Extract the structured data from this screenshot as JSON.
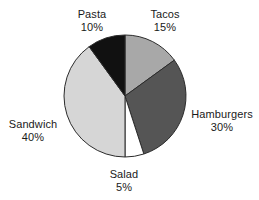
{
  "chart_data": {
    "type": "pie",
    "title": "",
    "subtitle": "",
    "xlabel": "",
    "ylabel": "",
    "legend_position": "none",
    "grid": false,
    "label_format": "name + percent",
    "start_angle_deg": 0,
    "direction": "clockwise",
    "categories": [
      "Tacos",
      "Hamburgers",
      "Salad",
      "Sandwich",
      "Pasta"
    ],
    "values": [
      15,
      30,
      5,
      40,
      10
    ],
    "slices": [
      {
        "name": "Tacos",
        "percent": 15,
        "percent_text": "15%",
        "color": "#a8a8a8",
        "stroke": "#2b2b2b"
      },
      {
        "name": "Hamburgers",
        "percent": 30,
        "percent_text": "30%",
        "color": "#555555",
        "stroke": "#2b2b2b"
      },
      {
        "name": "Salad",
        "percent": 5,
        "percent_text": "5%",
        "color": "#ffffff",
        "stroke": "#2b2b2b"
      },
      {
        "name": "Sandwich",
        "percent": 40,
        "percent_text": "40%",
        "color": "#d6d6d6",
        "stroke": "#2b2b2b"
      },
      {
        "name": "Pasta",
        "percent": 10,
        "percent_text": "10%",
        "color": "#111111",
        "stroke": "#2b2b2b"
      }
    ]
  },
  "labels": {
    "pasta": {
      "name": "Pasta",
      "percent": "10%"
    },
    "tacos": {
      "name": "Tacos",
      "percent": "15%"
    },
    "hamburgers": {
      "name": "Hamburgers",
      "percent": "30%"
    },
    "sandwich": {
      "name": "Sandwich",
      "percent": "40%"
    },
    "salad": {
      "name": "Salad",
      "percent": "5%"
    }
  },
  "geometry": {
    "center_x": 125,
    "center_y": 96,
    "radius": 61
  },
  "colors": {
    "background": "#ffffff",
    "text": "#1a1a1a",
    "outline": "#2b2b2b"
  }
}
